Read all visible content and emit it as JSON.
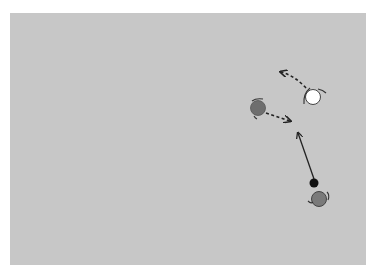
{
  "scene": {
    "background_color": "#c7c7c7",
    "page_color": "#ffffff",
    "agents": [
      {
        "id": "agent-white",
        "x": 313,
        "y": 97,
        "r": 8,
        "fill": "#ffffff",
        "arrow": {
          "type": "dashed",
          "path": "M306,88 Q295,76 280,73",
          "head": [
            280,
            73
          ]
        }
      },
      {
        "id": "agent-dark-left",
        "x": 258,
        "y": 108,
        "r": 8,
        "fill": "#6e6e6e",
        "arrow": {
          "type": "dashed",
          "path": "M266,113 L290,121",
          "head": [
            290,
            121
          ]
        }
      },
      {
        "id": "agent-dark-bottom",
        "x": 319,
        "y": 199,
        "r": 8,
        "fill": "#7a7a7a",
        "arrow": null
      }
    ],
    "ball": {
      "x": 314,
      "y": 183,
      "r": 5,
      "fill": "#111111"
    },
    "ball_arrow": {
      "type": "solid",
      "from": [
        314,
        178
      ],
      "to": [
        297,
        132
      ]
    }
  }
}
